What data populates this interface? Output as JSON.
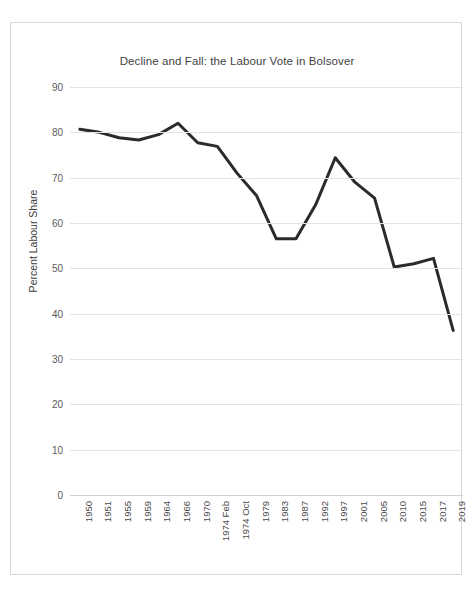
{
  "chart_data": {
    "type": "line",
    "title": "Decline and Fall: the Labour Vote in Bolsover",
    "xlabel": "",
    "ylabel": "Percent Labour Share",
    "ylim": [
      0,
      90
    ],
    "ytick_step": 10,
    "yticks": [
      90,
      80,
      70,
      60,
      50,
      40,
      30,
      20,
      10,
      0
    ],
    "grid": true,
    "legend": "none",
    "line_color": "#2b2b2b",
    "line_width": 3,
    "categories": [
      "1950",
      "1951",
      "1955",
      "1959",
      "1964",
      "1966",
      "1970",
      "1974 Feb",
      "1974 Oct",
      "1979",
      "1983",
      "1987",
      "1992",
      "1997",
      "2001",
      "2005",
      "2010",
      "2015",
      "2017",
      "2019"
    ],
    "series": [
      {
        "name": "Percent Labour Share",
        "values": [
          80.7,
          80.0,
          78.8,
          78.3,
          79.5,
          82.0,
          77.7,
          76.9,
          71.0,
          66.0,
          56.5,
          56.5,
          64.0,
          74.4,
          69.0,
          65.5,
          50.3,
          51.0,
          52.2,
          36.3
        ]
      }
    ]
  },
  "colors": {
    "frame_border": "#d9d9d9",
    "gridline": "#e4e4e4",
    "title_text": "#3f3f3f",
    "tick_text": "#5a5a5a",
    "background": "#ffffff"
  }
}
